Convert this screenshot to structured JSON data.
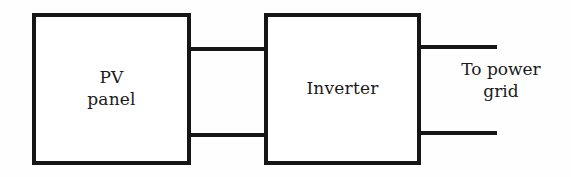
{
  "diagram": {
    "background_color": "#fefefe",
    "stroke_color": "#161616",
    "blocks": [
      {
        "id": "pv-panel",
        "label": "PV\npanel",
        "line1": "PV",
        "line2": "panel"
      },
      {
        "id": "inverter",
        "label": "Inverter"
      }
    ],
    "connections": [
      {
        "id": "dc-top",
        "from": "pv-panel",
        "to": "inverter",
        "position": "top"
      },
      {
        "id": "dc-bottom",
        "from": "pv-panel",
        "to": "inverter",
        "position": "bottom"
      },
      {
        "id": "ac-top",
        "from": "inverter",
        "to": "power-grid",
        "position": "top"
      },
      {
        "id": "ac-bottom",
        "from": "inverter",
        "to": "power-grid",
        "position": "bottom"
      }
    ],
    "annotations": [
      {
        "id": "grid-label",
        "label": "To power\ngrid",
        "line1": "To power",
        "line2": "grid"
      }
    ]
  }
}
